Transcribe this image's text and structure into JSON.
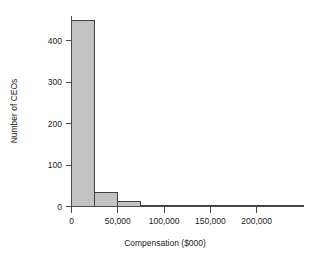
{
  "chart_data": {
    "type": "bar",
    "title": "",
    "subtitle": "",
    "xlabel": "Compensation ($000)",
    "ylabel": "Number of CEOs",
    "xlim": [
      0,
      250000
    ],
    "ylim": [
      0,
      460
    ],
    "xticks": [
      0,
      50000,
      100000,
      150000,
      200000
    ],
    "xtick_labels": [
      "0",
      "50,000",
      "100,000",
      "150,000",
      "200,000"
    ],
    "yticks": [
      0,
      100,
      200,
      300,
      400
    ],
    "ytick_labels": [
      "0",
      "100",
      "200",
      "300",
      "400"
    ],
    "grid": false,
    "legend": null,
    "bin_width": 25000,
    "bin_edges": [
      0,
      25000,
      50000,
      75000,
      100000,
      125000,
      150000,
      175000,
      200000,
      225000,
      250000
    ],
    "categories": [
      "0-25,000",
      "25,000-50,000",
      "50,000-75,000",
      "75,000-100,000",
      "100,000-125,000",
      "125,000-150,000",
      "150,000-175,000",
      "175,000-200,000",
      "200,000-225,000",
      "225,000-250,000"
    ],
    "values": [
      450,
      33,
      11,
      3,
      0,
      2,
      2,
      0,
      1,
      1
    ],
    "bar_fill": "#c2c2c2",
    "bar_edge": "#404040",
    "axis_color": "#4a4a4a"
  }
}
